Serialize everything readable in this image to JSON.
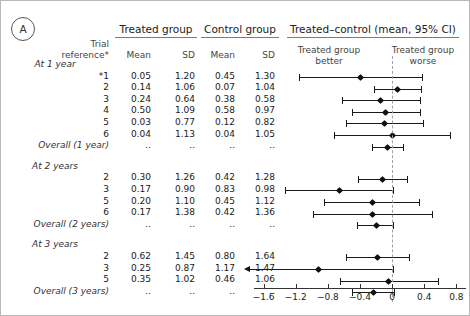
{
  "panel": {
    "letter": "A"
  },
  "headers": {
    "treated_group": "Treated group",
    "control_group": "Control group",
    "difference": "Treated–control (mean, 95% CI)",
    "trial_reference": "Trial reference*",
    "trial_reference_line1": "Trial",
    "trial_reference_line2": "reference*",
    "mean": "Mean",
    "sd": "SD",
    "better_line1": "Treated group",
    "better_line2": "better",
    "worse_line1": "Treated group",
    "worse_line2": "worse"
  },
  "axis": {
    "ticks": [
      "−1.6",
      "−1.2",
      "−0.8",
      "−0.4",
      "0",
      "0.4",
      "0.8"
    ],
    "tick_values": [
      -1.6,
      -1.2,
      -0.8,
      -0.4,
      0,
      0.4,
      0.8
    ],
    "min": -1.72,
    "max": 0.92,
    "zero": 0
  },
  "chart_data": {
    "type": "forest",
    "title": "Treated–control (mean, 95% CI)",
    "xlabel": "",
    "xlim": [
      -1.72,
      0.92
    ],
    "reference_line": 0,
    "left_annotation": "Treated group better",
    "right_annotation": "Treated group worse",
    "missing_marker": "..",
    "groups": [
      {
        "label": "At 1 year",
        "rows": [
          {
            "ref": "*1",
            "treated_mean": "0.05",
            "treated_sd": "1.20",
            "control_mean": "0.45",
            "control_sd": "1.30",
            "diff": -0.4,
            "lo": -1.16,
            "hi": 0.37
          },
          {
            "ref": "2",
            "treated_mean": "0.14",
            "treated_sd": "1.06",
            "control_mean": "0.07",
            "control_sd": "1.04",
            "diff": 0.07,
            "lo": -0.22,
            "hi": 0.36
          },
          {
            "ref": "3",
            "treated_mean": "0.24",
            "treated_sd": "0.64",
            "control_mean": "0.38",
            "control_sd": "0.58",
            "diff": -0.14,
            "lo": -0.63,
            "hi": 0.35
          },
          {
            "ref": "4",
            "treated_mean": "0.50",
            "treated_sd": "1.09",
            "control_mean": "0.58",
            "control_sd": "0.97",
            "diff": -0.08,
            "lo": -0.5,
            "hi": 0.35
          },
          {
            "ref": "5",
            "treated_mean": "0.03",
            "treated_sd": "0.77",
            "control_mean": "0.12",
            "control_sd": "0.82",
            "diff": -0.09,
            "lo": -0.57,
            "hi": 0.38
          },
          {
            "ref": "6",
            "treated_mean": "0.04",
            "treated_sd": "1.13",
            "control_mean": "0.04",
            "control_sd": "1.05",
            "diff": 0.0,
            "lo": -0.72,
            "hi": 0.72
          }
        ],
        "overall": {
          "ref": "Overall (1 year)",
          "treated_mean": "..",
          "treated_sd": "..",
          "control_mean": "..",
          "control_sd": "..",
          "diff": -0.06,
          "lo": -0.25,
          "hi": 0.13
        }
      },
      {
        "label": "At 2 years",
        "rows": [
          {
            "ref": "2",
            "treated_mean": "0.30",
            "treated_sd": "1.26",
            "control_mean": "0.42",
            "control_sd": "1.28",
            "diff": -0.12,
            "lo": -0.42,
            "hi": 0.18
          },
          {
            "ref": "3",
            "treated_mean": "0.17",
            "treated_sd": "0.90",
            "control_mean": "0.83",
            "control_sd": "0.98",
            "diff": -0.66,
            "lo": -1.33,
            "hi": 0.01
          },
          {
            "ref": "5",
            "treated_mean": "0.20",
            "treated_sd": "1.10",
            "control_mean": "0.45",
            "control_sd": "1.12",
            "diff": -0.25,
            "lo": -0.85,
            "hi": 0.33
          },
          {
            "ref": "6",
            "treated_mean": "0.17",
            "treated_sd": "1.38",
            "control_mean": "0.42",
            "control_sd": "1.36",
            "diff": -0.25,
            "lo": -0.99,
            "hi": 0.5
          }
        ],
        "overall": {
          "ref": "Overall (2 years)",
          "treated_mean": "..",
          "treated_sd": "..",
          "control_mean": "..",
          "control_sd": "..",
          "diff": -0.19,
          "lo": -0.44,
          "hi": 0.01
        }
      },
      {
        "label": "At 3 years",
        "rows": [
          {
            "ref": "2",
            "treated_mean": "0.62",
            "treated_sd": "1.45",
            "control_mean": "0.80",
            "control_sd": "1.64",
            "diff": -0.18,
            "lo": -0.57,
            "hi": 0.21
          },
          {
            "ref": "3",
            "treated_mean": "0.25",
            "treated_sd": "0.87",
            "control_mean": "1.17",
            "control_sd": "1.47",
            "diff": -0.92,
            "lo": -1.78,
            "hi": 0.01,
            "lo_arrow": true
          },
          {
            "ref": "5",
            "treated_mean": "0.35",
            "treated_sd": "1.02",
            "control_mean": "0.46",
            "control_sd": "1.06",
            "diff": -0.04,
            "lo": -0.65,
            "hi": 0.57
          }
        ],
        "overall": {
          "ref": "Overall (3 years)",
          "treated_mean": "..",
          "treated_sd": "..",
          "control_mean": "..",
          "control_sd": "..",
          "diff": -0.23,
          "lo": -0.5,
          "hi": 0.02
        }
      }
    ]
  }
}
